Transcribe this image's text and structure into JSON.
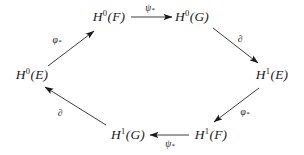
{
  "diagram": {
    "kind": "hexagonal-commutative-diagram",
    "background_color": "#ffffff",
    "ink_color": "#1a1a1a",
    "nodes": [
      {
        "id": "h0f",
        "name": "node-h0f",
        "base": "H",
        "superscript": "0",
        "argument": "(F)",
        "text": "H0(F)",
        "x": 109,
        "y": 17
      },
      {
        "id": "h0g",
        "name": "node-h0g",
        "base": "H",
        "superscript": "0",
        "argument": "(G)",
        "text": "H0(G)",
        "x": 192,
        "y": 17
      },
      {
        "id": "h1e",
        "name": "node-h1e",
        "base": "H",
        "superscript": "1",
        "argument": "(E)",
        "text": "H1(E)",
        "x": 272,
        "y": 75
      },
      {
        "id": "h1f",
        "name": "node-h1f",
        "base": "H",
        "superscript": "1",
        "argument": "(F)",
        "text": "H1(F)",
        "x": 211,
        "y": 135
      },
      {
        "id": "h1g",
        "name": "node-h1g",
        "base": "H",
        "superscript": "1",
        "argument": "(G)",
        "text": "H1(G)",
        "x": 128,
        "y": 135
      },
      {
        "id": "h0e",
        "name": "node-h0e",
        "base": "H",
        "superscript": "0",
        "argument": "(E)",
        "text": "H0(E)",
        "x": 32,
        "y": 75
      }
    ],
    "edges": [
      {
        "id": "e-h0e-h0f",
        "name": "arrow-h0e-to-h0f",
        "from": "h0e",
        "to": "h0f",
        "label_symbol": "φ",
        "label_sub": "*",
        "label_text": "φ*",
        "label_x": 57,
        "label_y": 41,
        "x1": 48,
        "y1": 66,
        "x2": 94,
        "y2": 31
      },
      {
        "id": "e-h0f-h0g",
        "name": "arrow-h0f-to-h0g",
        "from": "h0f",
        "to": "h0g",
        "label_symbol": "ψ",
        "label_sub": "*",
        "label_text": "ψ*",
        "label_x": 150,
        "label_y": 9,
        "x1": 131,
        "y1": 17,
        "x2": 172,
        "y2": 17
      },
      {
        "id": "e-h0g-h1e",
        "name": "arrow-h0g-to-h1e",
        "from": "h0g",
        "to": "h1e",
        "label_symbol": "∂",
        "label_sub": "",
        "label_text": "∂",
        "label_x": 240,
        "label_y": 40,
        "x1": 213,
        "y1": 28,
        "x2": 258,
        "y2": 63
      },
      {
        "id": "e-h1e-h1f",
        "name": "arrow-h1e-to-h1f",
        "from": "h1e",
        "to": "h1f",
        "label_symbol": "φ",
        "label_sub": "*",
        "label_text": "φ*",
        "label_x": 245,
        "label_y": 113,
        "x1": 259,
        "y1": 88,
        "x2": 214,
        "y2": 122
      },
      {
        "id": "e-h1f-h1g",
        "name": "arrow-h1f-to-h1g",
        "from": "h1f",
        "to": "h1g",
        "label_symbol": "ψ",
        "label_sub": "*",
        "label_text": "ψ*",
        "label_x": 170,
        "label_y": 145,
        "x1": 189,
        "y1": 135,
        "x2": 150,
        "y2": 135
      },
      {
        "id": "e-h1g-h0e",
        "name": "arrow-h1g-to-h0e",
        "from": "h1g",
        "to": "h0e",
        "label_symbol": "∂",
        "label_sub": "",
        "label_text": "∂",
        "label_x": 60,
        "label_y": 114,
        "x1": 106,
        "y1": 125,
        "x2": 45,
        "y2": 87
      }
    ]
  }
}
